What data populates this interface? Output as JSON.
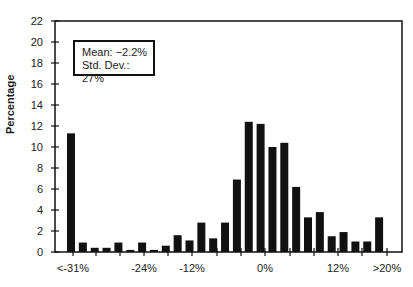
{
  "chart_data": {
    "type": "bar",
    "title": "",
    "xlabel": "",
    "ylabel": "Percentage",
    "ylim": [
      0,
      22
    ],
    "yticks": [
      0,
      2,
      4,
      6,
      8,
      10,
      12,
      14,
      16,
      18,
      20,
      22
    ],
    "xtick_labels": [
      "<-31%",
      "-24%",
      "-12%",
      "0%",
      "12%",
      ">20%"
    ],
    "categories": [
      "<-31%",
      "-30%",
      "-29%",
      "-28%",
      "-27%",
      "-26%",
      "-25%",
      "-24%",
      "-22%",
      "-20%",
      "-18%",
      "-16%",
      "-14%",
      "-12%",
      "-10%",
      "-2%",
      "0%",
      "2%",
      "4%",
      "6%",
      "8%",
      "10%",
      "12%",
      "14%",
      "16%",
      "18%",
      ">20%"
    ],
    "values": [
      11.3,
      0.9,
      0.4,
      0.4,
      0.9,
      0.2,
      0.9,
      0.2,
      0.6,
      1.6,
      1.1,
      2.8,
      1.3,
      2.8,
      6.9,
      12.4,
      12.2,
      10.0,
      10.4,
      6.2,
      3.3,
      3.8,
      1.5,
      1.9,
      1.0,
      1.0,
      3.3
    ],
    "annotations": [
      "Mean: −2.2%",
      "Std. Dev.: 27%"
    ],
    "grid": false,
    "legend_position": "upper left",
    "bar_color": "#111111"
  },
  "legend": {
    "mean": "Mean: −2.2%",
    "std": "Std. Dev.: 27%"
  },
  "axis": {
    "ylabel": "Percentage"
  }
}
